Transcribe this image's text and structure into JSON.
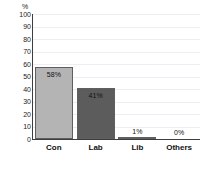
{
  "chart_data": {
    "type": "bar",
    "title": "",
    "subtitle": "",
    "xlabel": "",
    "ylabel": "%",
    "ylim": [
      0,
      100
    ],
    "yticks": [
      0,
      10,
      20,
      30,
      40,
      50,
      60,
      70,
      80,
      90,
      100
    ],
    "grid": true,
    "legend": "none",
    "categories": [
      "Con",
      "Lab",
      "Lib",
      "Others"
    ],
    "values": [
      58,
      41,
      1,
      0
    ],
    "data_labels": [
      "58%",
      "41%",
      "1%",
      "0%"
    ],
    "bar_colors": [
      "#b4b4b4",
      "#5c5c5c",
      "#b4b4b4",
      "#b4b4b4"
    ],
    "bar_border_color": "#5f5f5f",
    "axis_color": "#3d3d3d",
    "gridline_color": "#ededf2",
    "background_color": "#ffffff"
  },
  "axis": {
    "unit_label": "%",
    "tick_labels": [
      "100",
      "90",
      "80",
      "70",
      "60",
      "50",
      "40",
      "30",
      "20",
      "10",
      "0"
    ]
  },
  "bars": [
    {
      "category": "Con",
      "value": 58,
      "label": "58%"
    },
    {
      "category": "Lab",
      "value": 41,
      "label": "41%"
    },
    {
      "category": "Lib",
      "value": 1,
      "label": "1%"
    },
    {
      "category": "Others",
      "value": 0,
      "label": "0%"
    }
  ]
}
